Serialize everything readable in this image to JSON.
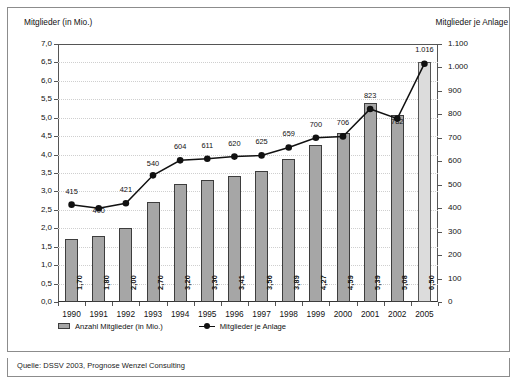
{
  "chart_data": {
    "type": "bar",
    "title": "",
    "categories": [
      "1990",
      "1991",
      "1992",
      "1993",
      "1994",
      "1995",
      "1996",
      "1997",
      "1998",
      "1999",
      "2000",
      "2001",
      "2002",
      "2005"
    ],
    "series": [
      {
        "name": "Anzahl Mitglieder (in Mio.)",
        "type": "bar",
        "axis": "left",
        "values": [
          1.7,
          1.8,
          2.0,
          2.7,
          3.2,
          3.3,
          3.41,
          3.56,
          3.89,
          4.27,
          4.59,
          5.39,
          5.08,
          6.5
        ],
        "value_labels": [
          "1,70",
          "1,80",
          "2,00",
          "2,70",
          "3,20",
          "3,30",
          "3,41",
          "3,56",
          "3,89",
          "4,27",
          "4,59",
          "5,39",
          "5,08",
          "6,50"
        ],
        "color": "#a6a6a6",
        "forecast_index": 13,
        "forecast_color": "#dcdcdc"
      },
      {
        "name": "Mitglieder je Anlage",
        "type": "line",
        "axis": "right",
        "values": [
          415,
          400,
          421,
          540,
          604,
          611,
          620,
          625,
          659,
          700,
          706,
          823,
          782,
          1016
        ],
        "value_labels": [
          "415",
          "400",
          "421",
          "540",
          "604",
          "611",
          "620",
          "625",
          "659",
          "700",
          "706",
          "823",
          "782",
          "1.016"
        ],
        "color": "#111111"
      }
    ],
    "xlabel": "",
    "ylabel_left": "Mitglieder (in Mio.)",
    "ylabel_right": "Mitglieder je Anlage",
    "ylim_left": [
      0.0,
      7.0
    ],
    "ylim_right": [
      0,
      1100
    ],
    "yticks_left": [
      "0,0",
      "0,5",
      "1,0",
      "1,5",
      "2,0",
      "2,5",
      "3,0",
      "3,5",
      "4,0",
      "4,5",
      "5,0",
      "5,5",
      "6,0",
      "6,5",
      "7,0"
    ],
    "yticks_right": [
      "0",
      "100",
      "200",
      "300",
      "400",
      "500",
      "600",
      "700",
      "800",
      "900",
      "1.000",
      "1.100"
    ],
    "grid": true,
    "legend_position": "bottom-left"
  },
  "axis_titles": {
    "left": "Mitglieder (in Mio.)",
    "right": "Mitglieder je Anlage"
  },
  "legend": {
    "bars_label": "Anzahl Mitglieder (in Mio.)",
    "line_label": "Mitglieder je Anlage"
  },
  "source": {
    "text": "Quelle: DSSV 2003, Prognose Wenzel Consulting"
  }
}
